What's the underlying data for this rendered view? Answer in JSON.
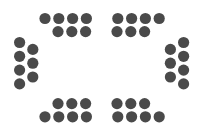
{
  "canvas": {
    "width": 203,
    "height": 136,
    "background_color": "#ffffff",
    "title": "Seating arrangement icon"
  },
  "style": {
    "dot_color": "#4a4a4a",
    "dot_radius": 5.6,
    "dot_diameter": 11.2
  },
  "diagram": {
    "type": "seating-layout",
    "total_seats": 28,
    "cluster_count": 4,
    "seats_per_cluster": 7
  },
  "clusters": [
    {
      "name": "top-left-cluster",
      "label": "Top left seating block",
      "seat_count": 7,
      "seats": [
        {
          "cx": 45.0,
          "cy": 18.5
        },
        {
          "cx": 58.8,
          "cy": 18.5
        },
        {
          "cx": 72.6,
          "cy": 18.5
        },
        {
          "cx": 86.4,
          "cy": 18.5
        },
        {
          "cx": 58.0,
          "cy": 31.6
        },
        {
          "cx": 71.8,
          "cy": 31.6
        },
        {
          "cx": 85.6,
          "cy": 31.6
        }
      ]
    },
    {
      "name": "top-right-cluster",
      "label": "Top right seating block",
      "seat_count": 7,
      "seats": [
        {
          "cx": 117.8,
          "cy": 18.5
        },
        {
          "cx": 131.6,
          "cy": 18.5
        },
        {
          "cx": 145.4,
          "cy": 18.5
        },
        {
          "cx": 159.2,
          "cy": 18.5
        },
        {
          "cx": 117.0,
          "cy": 31.6
        },
        {
          "cx": 130.8,
          "cy": 31.6
        },
        {
          "cx": 144.6,
          "cy": 31.6
        }
      ]
    },
    {
      "name": "left-side-cluster",
      "label": "Left side seating block",
      "seat_count": 7,
      "seats": [
        {
          "cx": 19.6,
          "cy": 42.5
        },
        {
          "cx": 19.6,
          "cy": 56.3
        },
        {
          "cx": 19.6,
          "cy": 70.1
        },
        {
          "cx": 19.6,
          "cy": 83.9
        },
        {
          "cx": 32.8,
          "cy": 49.4
        },
        {
          "cx": 32.8,
          "cy": 63.2
        },
        {
          "cx": 32.8,
          "cy": 77.0
        }
      ]
    },
    {
      "name": "right-side-cluster",
      "label": "Right side seating block",
      "seat_count": 7,
      "seats": [
        {
          "cx": 183.6,
          "cy": 42.5
        },
        {
          "cx": 183.6,
          "cy": 56.3
        },
        {
          "cx": 183.6,
          "cy": 70.1
        },
        {
          "cx": 183.6,
          "cy": 83.9
        },
        {
          "cx": 170.4,
          "cy": 49.4
        },
        {
          "cx": 170.4,
          "cy": 63.2
        },
        {
          "cx": 170.4,
          "cy": 77.0
        }
      ]
    },
    {
      "name": "bottom-left-cluster",
      "label": "Bottom left seating block",
      "seat_count": 7,
      "seats": [
        {
          "cx": 58.0,
          "cy": 103.6
        },
        {
          "cx": 71.8,
          "cy": 103.6
        },
        {
          "cx": 85.6,
          "cy": 103.6
        },
        {
          "cx": 45.0,
          "cy": 116.8
        },
        {
          "cx": 58.8,
          "cy": 116.8
        },
        {
          "cx": 72.6,
          "cy": 116.8
        },
        {
          "cx": 86.4,
          "cy": 116.8
        }
      ]
    },
    {
      "name": "bottom-right-cluster",
      "label": "Bottom right seating block",
      "seat_count": 7,
      "seats": [
        {
          "cx": 117.0,
          "cy": 103.6
        },
        {
          "cx": 130.8,
          "cy": 103.6
        },
        {
          "cx": 144.6,
          "cy": 103.6
        },
        {
          "cx": 117.8,
          "cy": 116.8
        },
        {
          "cx": 131.6,
          "cy": 116.8
        },
        {
          "cx": 145.4,
          "cy": 116.8
        },
        {
          "cx": 159.2,
          "cy": 116.8
        }
      ]
    }
  ]
}
